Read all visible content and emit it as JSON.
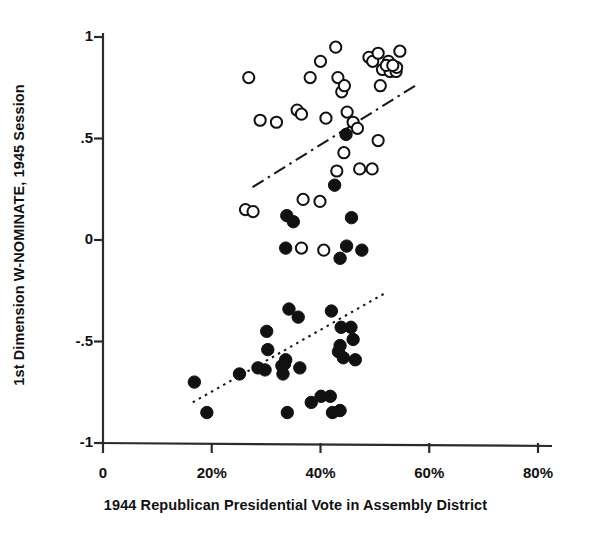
{
  "chart_data": {
    "type": "scatter",
    "title": "",
    "xlabel": "1944 Republican Presidential Vote in Assembly District",
    "ylabel": "1st Dimension W-NOMINATE, 1945 Session",
    "xlim": [
      0,
      80
    ],
    "ylim": [
      -1,
      1
    ],
    "grid": false,
    "legend": "none",
    "xticks": [
      {
        "value": 0,
        "label": "0"
      },
      {
        "value": 20,
        "label": "20%"
      },
      {
        "value": 40,
        "label": "40%"
      },
      {
        "value": 60,
        "label": "60%"
      },
      {
        "value": 80,
        "label": "80%"
      }
    ],
    "yticks": [
      {
        "value": 1,
        "label": "1"
      },
      {
        "value": 0.5,
        "label": ".5"
      },
      {
        "value": 0,
        "label": "0"
      },
      {
        "value": -0.5,
        "label": "-.5"
      },
      {
        "value": -1,
        "label": "-1"
      }
    ],
    "series": [
      {
        "name": "Republicans (hollow circles)",
        "marker": "open-circle",
        "color": "#111111",
        "points": [
          [
            26.8,
            0.8
          ],
          [
            28.9,
            0.59
          ],
          [
            31.9,
            0.58
          ],
          [
            35.7,
            0.64
          ],
          [
            36.5,
            0.62
          ],
          [
            38.1,
            0.8
          ],
          [
            40.0,
            0.88
          ],
          [
            41.0,
            0.6
          ],
          [
            42.8,
            0.95
          ],
          [
            43.2,
            0.8
          ],
          [
            43.9,
            0.73
          ],
          [
            44.4,
            0.76
          ],
          [
            44.9,
            0.63
          ],
          [
            46.0,
            0.58
          ],
          [
            46.8,
            0.55
          ],
          [
            47.2,
            0.35
          ],
          [
            44.3,
            0.43
          ],
          [
            43.0,
            0.34
          ],
          [
            49.5,
            0.35
          ],
          [
            50.6,
            0.49
          ],
          [
            48.9,
            0.9
          ],
          [
            49.6,
            0.88
          ],
          [
            50.6,
            0.92
          ],
          [
            52.5,
            0.88
          ],
          [
            51.4,
            0.84
          ],
          [
            52.8,
            0.83
          ],
          [
            53.9,
            0.83
          ],
          [
            54.6,
            0.93
          ],
          [
            54.0,
            0.85
          ],
          [
            51.0,
            0.76
          ],
          [
            52.1,
            0.86
          ],
          [
            53.3,
            0.86
          ],
          [
            36.8,
            0.2
          ],
          [
            39.9,
            0.19
          ],
          [
            26.2,
            0.15
          ],
          [
            27.6,
            0.14
          ],
          [
            36.5,
            -0.04
          ],
          [
            40.6,
            -0.05
          ]
        ]
      },
      {
        "name": "Democrats (filled circles)",
        "marker": "filled-circle",
        "color": "#111111",
        "points": [
          [
            44.7,
            0.52
          ],
          [
            42.6,
            0.27
          ],
          [
            33.8,
            0.12
          ],
          [
            35.0,
            0.09
          ],
          [
            45.7,
            0.11
          ],
          [
            33.6,
            -0.04
          ],
          [
            44.8,
            -0.03
          ],
          [
            43.6,
            -0.09
          ],
          [
            47.6,
            -0.05
          ],
          [
            16.8,
            -0.7
          ],
          [
            19.1,
            -0.85
          ],
          [
            25.1,
            -0.66
          ],
          [
            28.5,
            -0.63
          ],
          [
            29.8,
            -0.64
          ],
          [
            30.1,
            -0.45
          ],
          [
            30.3,
            -0.54
          ],
          [
            32.9,
            -0.62
          ],
          [
            33.1,
            -0.66
          ],
          [
            33.6,
            -0.59
          ],
          [
            33.4,
            -0.61
          ],
          [
            35.9,
            -0.38
          ],
          [
            33.9,
            -0.85
          ],
          [
            36.2,
            -0.63
          ],
          [
            34.2,
            -0.34
          ],
          [
            38.3,
            -0.8
          ],
          [
            40.1,
            -0.77
          ],
          [
            41.8,
            -0.77
          ],
          [
            42.0,
            -0.35
          ],
          [
            42.2,
            -0.85
          ],
          [
            43.6,
            -0.84
          ],
          [
            43.8,
            -0.43
          ],
          [
            43.3,
            -0.55
          ],
          [
            43.6,
            -0.52
          ],
          [
            45.6,
            -0.43
          ],
          [
            46.0,
            -0.49
          ],
          [
            46.4,
            -0.59
          ],
          [
            44.2,
            -0.58
          ]
        ]
      }
    ],
    "trendlines": [
      {
        "name": "republican-trend",
        "style": "dash-dot",
        "x1": 27.5,
        "y1": 0.26,
        "x2": 58.0,
        "y2": 0.77
      },
      {
        "name": "democrat-trend",
        "style": "dotted",
        "x1": 16.5,
        "y1": -0.8,
        "x2": 52.0,
        "y2": -0.26
      }
    ]
  }
}
